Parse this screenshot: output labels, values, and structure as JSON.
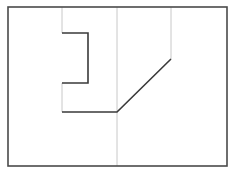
{
  "diagram": {
    "width": 233,
    "height": 174,
    "colors": {
      "background": "#ffffff",
      "frame": "#4a4a4a",
      "dark_line": "#3a3a3a",
      "guide_line": "#c8c8c8"
    },
    "frame": {
      "x": 8,
      "y": 7,
      "width": 219,
      "height": 159
    },
    "guide_lines": [
      {
        "x1": 62,
        "y1": 7,
        "x2": 62,
        "y2": 33
      },
      {
        "x1": 62,
        "y1": 83,
        "x2": 62,
        "y2": 112
      },
      {
        "x1": 117,
        "y1": 7,
        "x2": 117,
        "y2": 166
      },
      {
        "x1": 171,
        "y1": 7,
        "x2": 171,
        "y2": 59
      }
    ],
    "profile_path": [
      {
        "x": 62,
        "y": 33
      },
      {
        "x": 88,
        "y": 33
      },
      {
        "x": 88,
        "y": 83
      },
      {
        "x": 62,
        "y": 83
      }
    ],
    "profile_path_2": [
      {
        "x": 62,
        "y": 112
      },
      {
        "x": 117,
        "y": 112
      },
      {
        "x": 171,
        "y": 59
      }
    ]
  }
}
